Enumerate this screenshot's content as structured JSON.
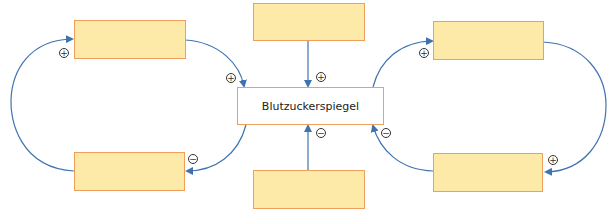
{
  "diagram": {
    "center": {
      "label": "Blutzuckerspiegel"
    },
    "boxes": [
      {
        "id": "left-top",
        "label": ""
      },
      {
        "id": "left-bottom",
        "label": ""
      },
      {
        "id": "top-center",
        "label": ""
      },
      {
        "id": "bottom-center",
        "label": ""
      },
      {
        "id": "right-top",
        "label": ""
      },
      {
        "id": "right-bottom",
        "label": ""
      }
    ],
    "signs": {
      "left_loop_plus": "+",
      "left_top_to_center_plus": "+",
      "center_to_left_bottom_minus": "−",
      "top_center_plus": "+",
      "bottom_center_minus": "−",
      "center_to_right_top_plus": "+",
      "right_bottom_to_center_minus": "−",
      "right_loop_plus": "+"
    },
    "colors": {
      "box_fill": "#fdeaa9",
      "box_border": "#ef9f5c",
      "arrow": "#3f73b0"
    }
  }
}
